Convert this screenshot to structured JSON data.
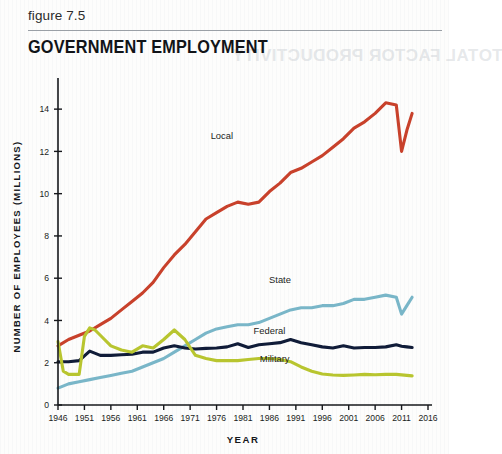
{
  "figure": {
    "label": "figure 7.5",
    "title": "GOVERNMENT EMPLOYMENT",
    "ghost_text": "TOTAL FACTOR PRODUCTIVITY"
  },
  "chart_data": {
    "type": "line",
    "title": "GOVERNMENT EMPLOYMENT",
    "xlabel": "YEAR",
    "ylabel": "NUMBER OF EMPLOYEES (MILLIONS)",
    "xlim": [
      1946,
      2016
    ],
    "ylim": [
      0,
      15
    ],
    "xticks": [
      1946,
      1951,
      1956,
      1961,
      1966,
      1971,
      1976,
      1981,
      1986,
      1991,
      1996,
      2001,
      2006,
      2011,
      2016
    ],
    "yticks": [
      0,
      2,
      4,
      6,
      8,
      10,
      12,
      14
    ],
    "grid": false,
    "legend_position": "inline-annotations",
    "colors": {
      "local": "#C8412B",
      "state": "#79B6C8",
      "federal": "#101C38",
      "military": "#B8C52F"
    },
    "series": [
      {
        "name": "Local",
        "color": "#C8412B",
        "label_x": 1977,
        "label_y": 12.6,
        "x": [
          1946,
          1948,
          1950,
          1952,
          1954,
          1956,
          1958,
          1960,
          1962,
          1964,
          1966,
          1968,
          1970,
          1972,
          1974,
          1976,
          1978,
          1980,
          1982,
          1984,
          1986,
          1988,
          1990,
          1992,
          1994,
          1996,
          1998,
          2000,
          2002,
          2004,
          2006,
          2008,
          2010,
          2011,
          2012,
          2013
        ],
        "values": [
          2.8,
          3.1,
          3.3,
          3.5,
          3.8,
          4.1,
          4.5,
          4.9,
          5.3,
          5.8,
          6.5,
          7.1,
          7.6,
          8.2,
          8.8,
          9.1,
          9.4,
          9.6,
          9.5,
          9.6,
          10.1,
          10.5,
          11.0,
          11.2,
          11.5,
          11.8,
          12.2,
          12.6,
          13.1,
          13.4,
          13.8,
          14.3,
          14.2,
          12.0,
          13.0,
          13.8
        ]
      },
      {
        "name": "State",
        "color": "#79B6C8",
        "label_x": 1988,
        "label_y": 5.75,
        "x": [
          1946,
          1948,
          1950,
          1952,
          1954,
          1956,
          1958,
          1960,
          1962,
          1964,
          1966,
          1968,
          1970,
          1972,
          1974,
          1976,
          1978,
          1980,
          1982,
          1984,
          1986,
          1988,
          1990,
          1992,
          1994,
          1996,
          1998,
          2000,
          2002,
          2004,
          2006,
          2008,
          2010,
          2011,
          2012,
          2013
        ],
        "values": [
          0.8,
          1.0,
          1.1,
          1.2,
          1.3,
          1.4,
          1.5,
          1.6,
          1.8,
          2.0,
          2.2,
          2.5,
          2.8,
          3.1,
          3.4,
          3.6,
          3.7,
          3.8,
          3.8,
          3.9,
          4.1,
          4.3,
          4.5,
          4.6,
          4.6,
          4.7,
          4.7,
          4.8,
          5.0,
          5.0,
          5.1,
          5.2,
          5.1,
          4.3,
          4.7,
          5.1
        ]
      },
      {
        "name": "Federal",
        "color": "#101C38",
        "label_x": 1986,
        "label_y": 3.35,
        "x": [
          1946,
          1948,
          1950,
          1952,
          1954,
          1956,
          1958,
          1960,
          1962,
          1964,
          1966,
          1968,
          1970,
          1972,
          1974,
          1976,
          1978,
          1980,
          1982,
          1984,
          1986,
          1988,
          1990,
          1992,
          1994,
          1996,
          1998,
          2000,
          2002,
          2004,
          2006,
          2008,
          2010,
          2011,
          2012,
          2013
        ],
        "values": [
          2.05,
          2.05,
          2.1,
          2.55,
          2.35,
          2.35,
          2.38,
          2.4,
          2.5,
          2.5,
          2.7,
          2.8,
          2.7,
          2.65,
          2.68,
          2.7,
          2.75,
          2.9,
          2.72,
          2.85,
          2.9,
          2.95,
          3.1,
          2.95,
          2.85,
          2.75,
          2.7,
          2.8,
          2.7,
          2.72,
          2.72,
          2.75,
          2.85,
          2.78,
          2.75,
          2.72
        ]
      },
      {
        "name": "Military",
        "color": "#B8C52F",
        "label_x": 1987,
        "label_y": 2.05,
        "x": [
          1946,
          1947,
          1948,
          1950,
          1951,
          1952,
          1953,
          1954,
          1956,
          1958,
          1960,
          1962,
          1964,
          1966,
          1968,
          1970,
          1972,
          1974,
          1976,
          1978,
          1980,
          1982,
          1984,
          1986,
          1988,
          1990,
          1992,
          1994,
          1996,
          1998,
          2000,
          2002,
          2004,
          2006,
          2008,
          2010,
          2012,
          2013
        ],
        "values": [
          3.0,
          1.6,
          1.45,
          1.45,
          3.25,
          3.65,
          3.55,
          3.3,
          2.8,
          2.6,
          2.5,
          2.8,
          2.7,
          3.1,
          3.55,
          3.1,
          2.35,
          2.2,
          2.1,
          2.1,
          2.1,
          2.15,
          2.2,
          2.2,
          2.15,
          2.05,
          1.8,
          1.6,
          1.47,
          1.42,
          1.4,
          1.42,
          1.45,
          1.43,
          1.45,
          1.45,
          1.4,
          1.38
        ]
      }
    ]
  }
}
